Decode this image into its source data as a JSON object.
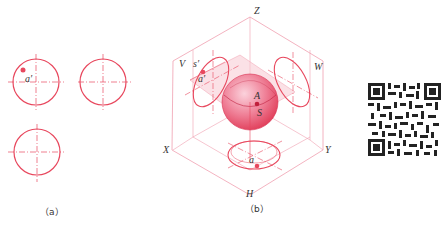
{
  "figure_a": {
    "caption": "（a）",
    "views": [
      {
        "name": "front-view",
        "point_label": "a",
        "point_prime": "′"
      },
      {
        "name": "side-view"
      },
      {
        "name": "top-view"
      }
    ]
  },
  "figure_b": {
    "caption": "（b）",
    "axes": {
      "z": "Z",
      "x": "X",
      "y": "Y"
    },
    "planes": {
      "v": "V",
      "w": "W",
      "h": "H"
    },
    "labels": {
      "s_prime": "s′",
      "a_prime": "a′",
      "A": "A",
      "S": "S",
      "a": "a"
    }
  },
  "qr_code": {
    "present": true
  },
  "colors": {
    "line": "#e8485e",
    "frame": "#f0a0b0",
    "sphere_light": "#f7b6c4",
    "sphere_dark": "#e2405a",
    "plane_fill": "#f8c8d2",
    "text": "#333333"
  }
}
